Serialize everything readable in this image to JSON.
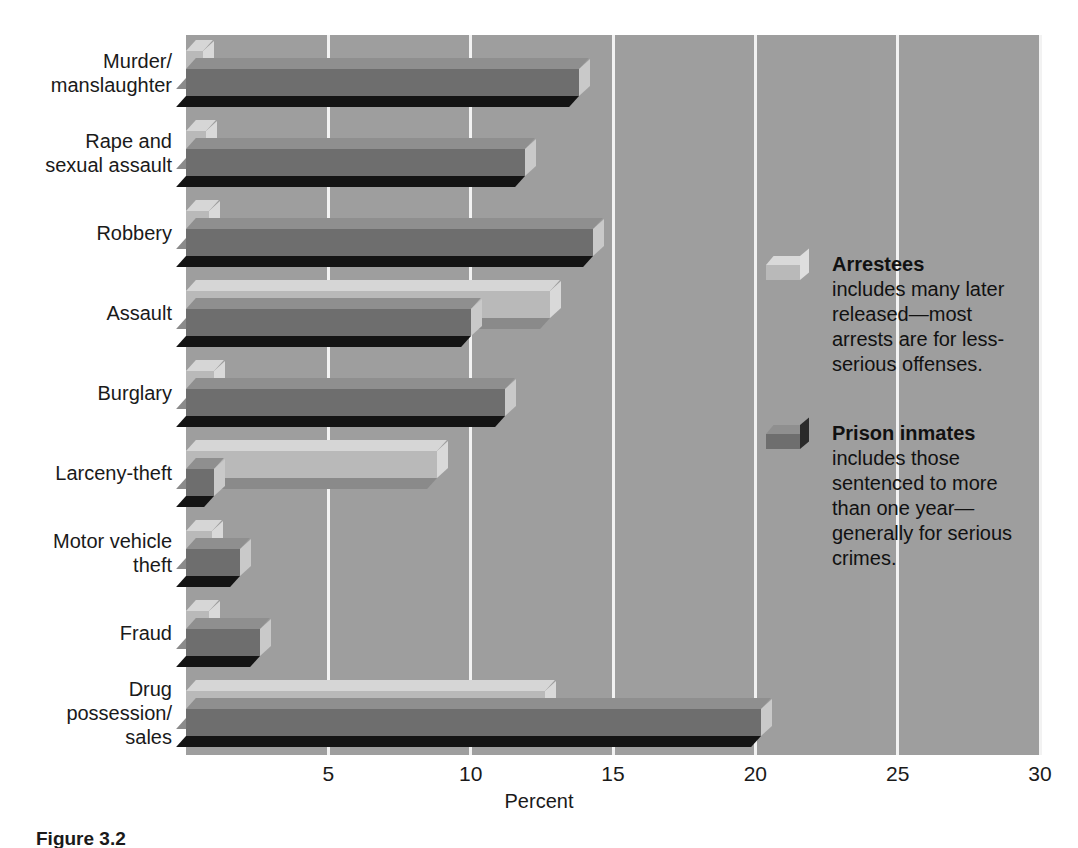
{
  "chart_data": {
    "type": "bar",
    "orientation": "horizontal",
    "title": "",
    "xlabel": "Percent",
    "ylabel": "",
    "xlim": [
      0,
      30
    ],
    "xticks": [
      5,
      10,
      15,
      20,
      25,
      30
    ],
    "xticklabels": [
      "5",
      "10",
      "15",
      "20",
      "25",
      "30"
    ],
    "grid": true,
    "legend_position": "right",
    "categories": [
      "Murder/\nmanslaughter",
      "Rape and\nsexual assault",
      "Robbery",
      "Assault",
      "Burglary",
      "Larceny-theft",
      "Motor vehicle\ntheft",
      "Fraud",
      "Drug\npossession/\nsales"
    ],
    "series": [
      {
        "name": "Arrestees",
        "color": "#b9b9b9",
        "values": [
          0.6,
          0.7,
          0.8,
          12.8,
          1.0,
          8.8,
          0.9,
          0.8,
          12.6
        ]
      },
      {
        "name": "Prison inmates",
        "color": "#6e6e6e",
        "values": [
          13.8,
          11.9,
          14.3,
          10.0,
          11.2,
          1.0,
          1.9,
          2.6,
          20.2
        ]
      }
    ]
  },
  "axis": {
    "x_title": "Percent"
  },
  "legend": {
    "entries": [
      {
        "swatch": "arrestees-swatch",
        "title": "Arrestees",
        "description": "includes many later released—most arrests are for less-serious offenses."
      },
      {
        "swatch": "prison-inmates-swatch",
        "title": "Prison inmates",
        "description": "includes those sentenced to more than one year—generally for serious crimes."
      }
    ]
  },
  "caption": {
    "text": "Figure 3.2"
  },
  "colors": {
    "plot_background": "#9e9e9e",
    "gridline": "#f2f2f2",
    "arrestees": "#b9b9b9",
    "prison_inmates": "#6e6e6e",
    "page_background": "#ffffff",
    "text": "#1a1a1a"
  }
}
